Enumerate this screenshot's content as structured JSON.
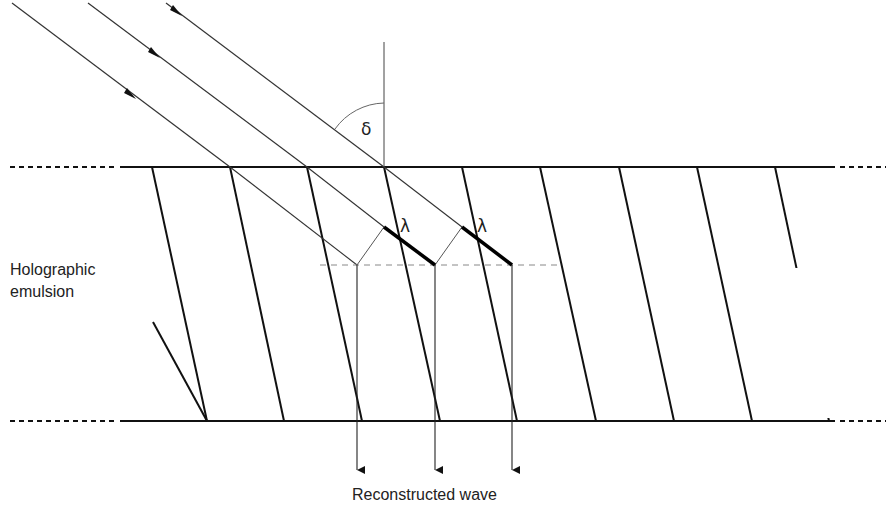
{
  "labels": {
    "emulsion_line1": "Holographic",
    "emulsion_line2": "emulsion",
    "output": "Reconstructed wave",
    "angle_symbol": "δ",
    "wavelength_symbol_1": "λ",
    "wavelength_symbol_2": "λ"
  },
  "colors": {
    "line": "#111111",
    "thin_line": "#333333",
    "construction": "#888888",
    "text": "#222222"
  },
  "geometry": {
    "emulsion_top_y": 167,
    "emulsion_bottom_y": 420,
    "plane_y": 265,
    "fringe_top_x": [
      230,
      307,
      384,
      462,
      540,
      619,
      697
    ],
    "fringe_shift_x": 78,
    "output_x": [
      357,
      435,
      512
    ]
  }
}
